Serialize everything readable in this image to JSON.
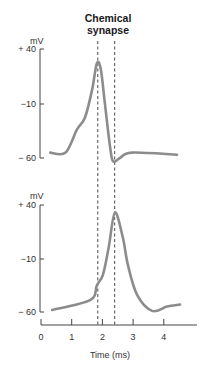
{
  "chart_data": {
    "type": "line",
    "title": "Chemical synapse",
    "title_lines": [
      "Chemical",
      "synapse"
    ],
    "xlabel": "Time (ms)",
    "x_ticks": [
      0,
      1,
      2,
      3,
      4
    ],
    "x_tick_labels": [
      "0",
      "1",
      "2",
      "3",
      "4"
    ],
    "xlim": [
      0,
      5
    ],
    "grid": false,
    "markers": [
      {
        "name": "presynaptic-peak",
        "x": 1.85,
        "style": "dashed"
      },
      {
        "name": "postsynaptic-peak",
        "x": 2.4,
        "style": "dashed"
      }
    ],
    "panels": [
      {
        "name": "presynaptic",
        "ylabel": "mV",
        "ylim": [
          -60,
          40
        ],
        "y_ticks": [
          40,
          -10,
          -60
        ],
        "y_tick_labels": [
          "+ 40",
          "−10",
          "− 60"
        ],
        "series": [
          {
            "name": "presynaptic-action-potential",
            "color": "#8c8c8c",
            "x": [
              0.3,
              0.8,
              1.17,
              1.43,
              1.66,
              1.82,
              1.95,
              2.08,
              2.25,
              2.35,
              2.57,
              2.96,
              4.43
            ],
            "y": [
              -55,
              -55,
              -34,
              -23,
              2,
              27,
              21,
              -10,
              -50,
              -63,
              -60,
              -55,
              -57
            ]
          }
        ]
      },
      {
        "name": "postsynaptic",
        "ylabel": "mV",
        "ylim": [
          -60,
          40
        ],
        "y_ticks": [
          40,
          -10,
          -60
        ],
        "y_tick_labels": [
          "+ 40",
          "−10",
          "− 60"
        ],
        "series": [
          {
            "name": "postsynaptic-action-potential",
            "color": "#8c8c8c",
            "x": [
              0.36,
              1.6,
              1.82,
              2.02,
              2.21,
              2.41,
              2.67,
              2.83,
              3.13,
              3.62,
              4.1,
              4.53
            ],
            "y": [
              -58,
              -49,
              -35,
              -25,
              1,
              33,
              9,
              -16,
              -44,
              -59,
              -55,
              -53
            ]
          }
        ]
      }
    ]
  }
}
